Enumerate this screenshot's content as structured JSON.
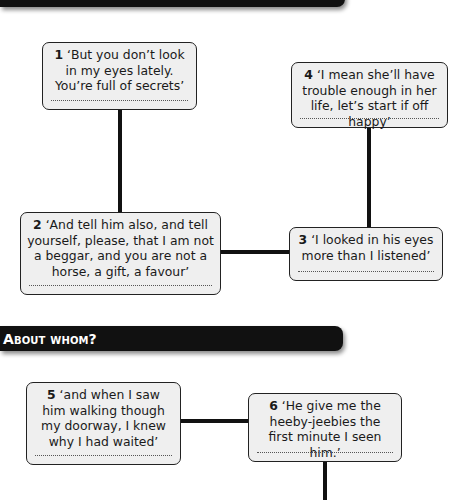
{
  "sections": [
    {
      "id": "top",
      "title": ""
    },
    {
      "id": "about-whom",
      "title": "About whom?"
    }
  ],
  "quotes": [
    {
      "number": "1",
      "text": " ‘But you don’t look in my eyes lately. You’re full of secrets’",
      "answer": ""
    },
    {
      "number": "2",
      "text": " ‘And tell him also, and tell yourself, please, that I am not a beggar, and you are not a horse, a gift, a favour’",
      "answer": ""
    },
    {
      "number": "3",
      "text": " ‘I looked in his eyes more than I listened’",
      "answer": ""
    },
    {
      "number": "4",
      "text": " ‘I mean she’ll have trouble enough in her life, let’s start if off happy’",
      "answer": ""
    },
    {
      "number": "5",
      "text": " ‘and when I saw him walking though my doorway, I knew why I had waited’",
      "answer": ""
    },
    {
      "number": "6",
      "text": " ‘He give me the heeby-jeebies the first minute I seen him.’",
      "answer": ""
    }
  ],
  "colors": {
    "banner": "#111111",
    "box_fill": "#efefef",
    "box_border": "#222222",
    "connector": "#111111"
  }
}
